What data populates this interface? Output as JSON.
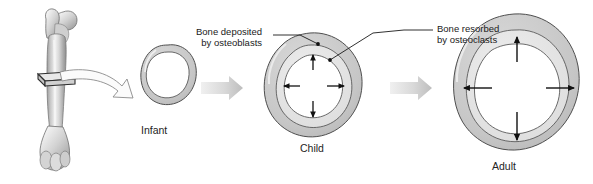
{
  "figure": {
    "stages": [
      {
        "id": "infant",
        "label": "Infant"
      },
      {
        "id": "child",
        "label": "Child"
      },
      {
        "id": "adult",
        "label": "Adult"
      }
    ],
    "callouts": [
      {
        "id": "deposited",
        "line1": "Bone deposited",
        "line2": "by osteoblasts"
      },
      {
        "id": "resorbed",
        "line1": "Bone resorbed",
        "line2": "by osteoclasts"
      }
    ],
    "icons": {
      "femur": "femur-bone-icon",
      "section_marker": "cross-section-slab-icon",
      "magnify_arrow": "curved-hollow-arrow-icon",
      "progress_arrow": "block-arrow-icon",
      "growth_arrow": "outward-growth-arrow-icon",
      "leader_dot": "leader-endpoint-dot-icon"
    },
    "colors": {
      "cortex_outer": "#c9c9c9",
      "cortex_inner": "#dedede",
      "marrow_cavity": "#ffffff",
      "outline": "#4a4a4a",
      "block_arrow": "#d5d5d5",
      "bone_body": "#c4c4c4",
      "text": "#1a1a1a"
    },
    "growth_arrow_counts": {
      "child": 4,
      "adult": 4
    },
    "background": "#ffffff"
  }
}
